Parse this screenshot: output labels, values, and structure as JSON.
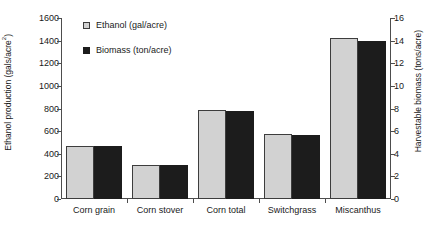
{
  "chart_data": {
    "type": "bar",
    "title": "",
    "categories": [
      "Corn grain",
      "Corn stover",
      "Corn total",
      "Switchgrass",
      "Miscanthus"
    ],
    "series": [
      {
        "name": "Ethanol (gal/acre)",
        "axis": "left",
        "color": "#d2d2d2",
        "values": [
          465,
          300,
          790,
          575,
          1425
        ]
      },
      {
        "name": "Biomass (ton/acre)",
        "axis": "right",
        "color": "#1c1c1c",
        "values": [
          4.7,
          3.0,
          7.8,
          5.7,
          14.0
        ]
      }
    ],
    "ylabel": "Ethanol production (gals/acre",
    "ylabel_sup": "2",
    "ylabel_tail": ")",
    "ylabel_right": "Harvestable biomass (tons/acre)",
    "xlabel": "",
    "ylim": [
      0,
      1600
    ],
    "ylim_right": [
      0,
      16
    ],
    "yticks": [
      0,
      200,
      400,
      600,
      800,
      1000,
      1200,
      1400,
      1600
    ],
    "yticks_right": [
      0,
      2,
      4,
      6,
      8,
      10,
      12,
      14,
      16
    ],
    "grid": false,
    "legend_position": "upper-left-inside"
  },
  "legend": {
    "items": [
      {
        "label": "Ethanol (gal/acre)",
        "swatch": "ethanol"
      },
      {
        "label": "Biomass (ton/acre)",
        "swatch": "biomass"
      }
    ]
  }
}
